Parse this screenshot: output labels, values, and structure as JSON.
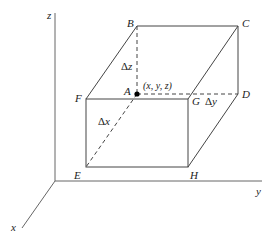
{
  "diagram": {
    "axes": {
      "x": "x",
      "y": "y",
      "z": "z"
    },
    "vertices": {
      "A": "A",
      "B": "B",
      "C": "C",
      "D": "D",
      "E": "E",
      "F": "F",
      "G": "G",
      "H": "H"
    },
    "point_label": "(x, y, z)",
    "increments": {
      "dx": "x",
      "dy": "y",
      "dz": "z"
    },
    "delta_symbol": "Δ",
    "colors": {
      "line": "#444444",
      "axis": "#555555",
      "point": "#000000"
    }
  }
}
